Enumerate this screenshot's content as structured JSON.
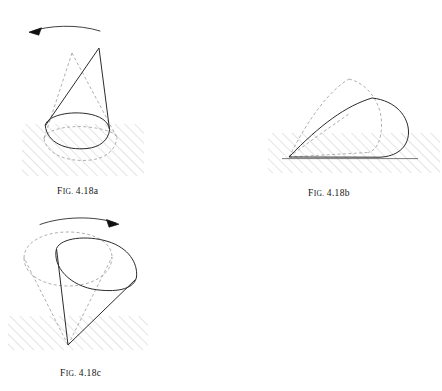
{
  "document": {
    "figure_group": "4.18",
    "subject": "rolling-cone-sequence"
  },
  "captions": [
    {
      "id": "a",
      "prefix_first": "F",
      "prefix_rest": "IG.",
      "number": "4.18a"
    },
    {
      "id": "b",
      "prefix_first": "F",
      "prefix_rest": "IG.",
      "number": "4.18b"
    },
    {
      "id": "c",
      "prefix_first": "F",
      "prefix_rest": "IG.",
      "number": "4.18c"
    }
  ],
  "style": {
    "solid_stroke": "#2b2b2b",
    "dashed_stroke": "#9a9a9a",
    "hatch_stroke": "#c9c9c9",
    "ground_line": "#3a3a3a",
    "background": "#ffffff",
    "solid_width": 1.0,
    "dashed_width": 0.8,
    "dash_pattern": "3,2.4"
  },
  "figures": [
    {
      "id": "fig-a",
      "label": "4.18a",
      "description": "upright cone tipped on its base rim, rotating",
      "arrow": {
        "name": "rotation-arrow-left",
        "direction": "counterclockwise-left",
        "path": "M 30 32 C 48 25 78 24 100 31",
        "head": "M 30 32 L 41 28.5 L 38.5 34.8 Z"
      },
      "solid": {
        "apex": [
          99,
          48
        ],
        "base_center": [
          77,
          130
        ],
        "base_rx": 33,
        "base_ry": 15,
        "base_rotation": -8,
        "left_edge": "M 99 48 L 45.5 126.5",
        "right_edge": "M 99 48 L 109 128",
        "base_front_arc": "M 45.2 125.2 C 47 143 66 150.5 87 148.5 C 100 147.2 108.4 140.2 109.6 129.6",
        "base_back_arc": "M 45.2 125.2 C 47.5 116.5 66 111 86 113.5 C 100.5 115.4 108.6 121.6 109.6 129.6"
      },
      "dashed": {
        "apex": [
          72,
          53
        ],
        "base_center": [
          80,
          140
        ],
        "left_edge": "M 72 53 L 44 139",
        "right_edge": "M 72 53 L 117 137",
        "base_front_arc": "M 44 138.5 C 46.5 154 66 162 89 160.2 C 106 158.7 116 149.5 117 137.5",
        "base_back_arc": "M 44 138.5 C 46 130 66 125 88 127 C 105 128.8 116 133 117 137.5"
      },
      "ground": {
        "hatch_rect": [
          22,
          124,
          122,
          52
        ],
        "name": "ground-hatching-a"
      }
    },
    {
      "id": "fig-b",
      "label": "4.18b",
      "description": "cone fallen onto its side, apex at lower-left, base circle at right",
      "arrow": null,
      "solid": {
        "apex": [
          289,
          157
        ],
        "top_edge": "M 289 157 C 320 125 345 106 372 98",
        "bottom_edge": "M 289 157 L 380 157",
        "base_arc": "M 372 98 C 396 100 409 117 408.5 133 C 408 148 396 156.5 380 157"
      },
      "dashed": {
        "apex": [
          289,
          157
        ],
        "top_edge": "M 289 157 C 310 116 330 90 349 79",
        "bottom_edge": "M 289 157 L 368 152",
        "base_arc": "M 349 79 C 369 84 380 104 381 122 C 382 140 376 150 368 152",
        "inner_edge": "M 289 157 C 315 138 334 124 349 113"
      },
      "ground": {
        "hatch_rect": [
          268,
          133,
          172,
          40
        ],
        "line": "M 280 159 L 420 159",
        "name": "ground-hatching-b"
      }
    },
    {
      "id": "fig-c",
      "label": "4.18c",
      "description": "inverted cone standing on apex, two positions overlapping",
      "arrow": {
        "name": "rotation-arrow-right",
        "direction": "clockwise-right",
        "path": "M 40 224 C 62 216 94 215 118 223",
        "head": "M 120 224 L 108 219.5 L 110.5 226.5 Z"
      },
      "solid": {
        "apex": [
          68,
          345
        ],
        "rim_center": [
          96,
          262
        ],
        "rim_rx": 44,
        "rim_ry": 28,
        "rim_rotation": -14,
        "left_edge": "M 68 345 L 56.5 248.5",
        "right_edge": "M 68 345 L 133 279",
        "rim_arc_front": "M 56.5 248.5 C 52 266 70 286 97 289.5 C 120 292.5 134 288 136.5 277",
        "rim_arc_back": "M 56.5 248.5 C 61 238 86 235 108 241.5 C 128 247.5 138 263 136.5 277"
      },
      "dashed": {
        "apex": [
          68,
          345
        ],
        "rim_center": [
          68,
          262
        ],
        "left_edge": "M 68 345 L 24 258",
        "right_edge": "M 68 345 L 112 256",
        "rim_arc_front": "M 24 258 C 24 275 44 286 68 286 C 92 286 112 274 112 257",
        "rim_arc_back": "M 24 258 C 24 242 44 232 68 232 C 92 232 112 241 112 257"
      },
      "ground": {
        "hatch_rect": [
          8,
          316,
          140,
          34
        ],
        "name": "ground-hatching-c"
      }
    }
  ]
}
